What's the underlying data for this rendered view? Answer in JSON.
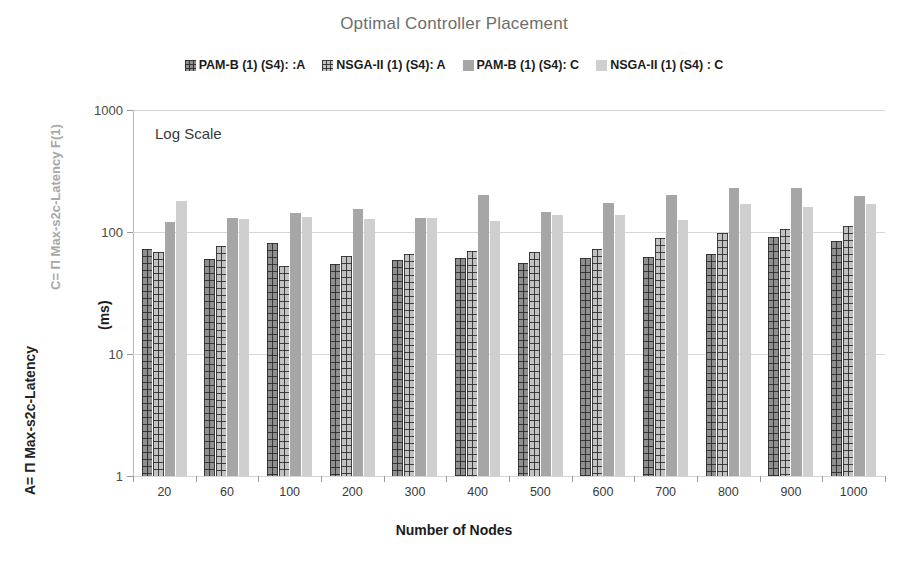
{
  "chart_data": {
    "type": "bar",
    "title": "Optimal Controller Placement",
    "xlabel": "Number of Nodes",
    "ylabel": "(ms)",
    "yscale": "log",
    "ylim": [
      1,
      1000
    ],
    "yticks": [
      "1",
      "10",
      "100",
      "1000"
    ],
    "grid": true,
    "legend_position": "top-center",
    "annotation": "Log Scale",
    "axis_note_left_outer": "A= Π Max-s2c-Latency",
    "axis_note_left_inner": "C= Π Max-s2c-Latency F(1)",
    "categories": [
      "20",
      "60",
      "100",
      "200",
      "300",
      "400",
      "500",
      "600",
      "700",
      "800",
      "900",
      "1000"
    ],
    "series": [
      {
        "name": "PAM-B (1) (S4): :A",
        "color": "#8f8f8f",
        "pattern": "grid",
        "values": [
          73,
          60,
          82,
          55,
          59,
          61,
          56,
          61,
          62,
          66,
          91,
          85
        ]
      },
      {
        "name": "NSGA-II (1) (S4): A",
        "color": "#c2c2c2",
        "pattern": "grid",
        "values": [
          68,
          77,
          53,
          63,
          66,
          70,
          68,
          72,
          89,
          98,
          105,
          112
        ]
      },
      {
        "name": "PAM-B (1) (S4): C",
        "color": "#a6a6a6",
        "pattern": "solid",
        "values": [
          120,
          130,
          142,
          155,
          131,
          200,
          147,
          172,
          202,
          230,
          228,
          198
        ]
      },
      {
        "name": "NSGA-II (1) (S4) : C",
        "color": "#cfcfcf",
        "pattern": "solid",
        "values": [
          180,
          128,
          133,
          128,
          130,
          124,
          138,
          139,
          126,
          170,
          160,
          170
        ]
      }
    ]
  },
  "title": {
    "text": "Optimal Controller Placement"
  },
  "legend": {
    "items": [
      {
        "label": "PAM-B (1) (S4): :A"
      },
      {
        "label": "NSGA-II (1) (S4): A"
      },
      {
        "label": "PAM-B (1) (S4): C"
      },
      {
        "label": "NSGA-II (1) (S4) : C"
      }
    ]
  },
  "axes": {
    "y_title": "(ms)",
    "x_title": "Number of Nodes",
    "left_label_outer": "A= Π Max-s2c-Latency",
    "left_label_inner": "C= Π Max-s2c-Latency F(1)",
    "annotation": "Log Scale"
  }
}
